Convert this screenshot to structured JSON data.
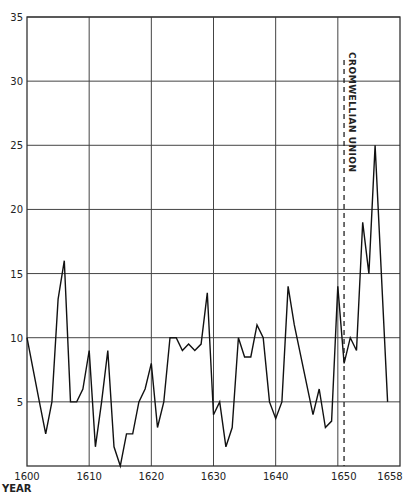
{
  "chart_data": {
    "type": "line",
    "title": "",
    "xlabel": "YEAR",
    "ylabel": "",
    "xlim": [
      1600,
      1660
    ],
    "ylim": [
      0,
      35
    ],
    "grid": true,
    "legend": null,
    "x_ticks": [
      {
        "value": 1600,
        "label": "1600"
      },
      {
        "value": 1610,
        "label": "1610"
      },
      {
        "value": 1620,
        "label": "1620"
      },
      {
        "value": 1630,
        "label": "1630"
      },
      {
        "value": 1640,
        "label": "1640"
      },
      {
        "value": 1650,
        "label": "1650"
      },
      {
        "value": 1658,
        "label": "1658"
      }
    ],
    "y_ticks": [
      5,
      10,
      15,
      20,
      25,
      30,
      35
    ],
    "series": [
      {
        "name": "annual values",
        "x": [
          1600,
          1601,
          1602,
          1603,
          1604,
          1605,
          1606,
          1607,
          1608,
          1609,
          1610,
          1611,
          1612,
          1613,
          1614,
          1615,
          1616,
          1617,
          1618,
          1619,
          1620,
          1621,
          1622,
          1623,
          1624,
          1625,
          1626,
          1627,
          1628,
          1629,
          1630,
          1631,
          1632,
          1633,
          1634,
          1635,
          1636,
          1637,
          1638,
          1639,
          1640,
          1641,
          1642,
          1643,
          1646,
          1647,
          1648,
          1649,
          1650,
          1651,
          1652,
          1653,
          1654,
          1655,
          1656,
          1658
        ],
        "values": [
          10,
          7.5,
          5,
          2.5,
          5,
          13,
          16,
          5,
          5,
          6,
          9,
          1.5,
          5,
          9,
          1.5,
          0,
          2.5,
          2.5,
          5,
          6,
          8,
          3,
          5,
          10,
          10,
          9,
          9.5,
          9,
          9.5,
          13.5,
          4,
          5,
          1.5,
          3,
          10,
          8.5,
          8.5,
          11,
          10,
          5,
          3.7,
          5,
          14,
          11,
          4,
          6,
          3,
          3.5,
          14,
          8,
          10,
          9,
          19,
          15,
          25,
          5
        ]
      }
    ],
    "annotations": [
      {
        "type": "vertical-dashed-line",
        "x": 1651,
        "label": "CROMWELLIAN UNION"
      }
    ]
  }
}
